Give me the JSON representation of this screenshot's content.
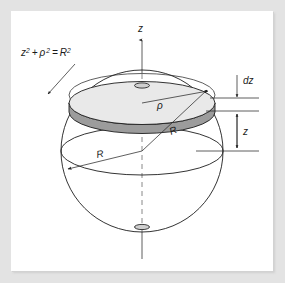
{
  "figure": {
    "background_color": "#e3e3e3",
    "panel_color": "#ffffff",
    "line_color": "#1d1d1d",
    "disk_top_color": "#e9e9e9",
    "disk_side_color": "#9c9c9c",
    "axis_dash_color": "#7c7c7c"
  },
  "labels": {
    "equation": {
      "base1": "z",
      "sup1": "2",
      "operator": "+",
      "base2": "ρ",
      "sup2": "2",
      "equals": "=",
      "base3": "R",
      "sup3": "2",
      "full_text": "z² + ρ² = R²"
    },
    "axis_z": "z",
    "disk_radius_rho": "ρ",
    "sphere_radius_slant": "R",
    "sphere_radius_equator": "R",
    "thickness_dz": "dz",
    "height_z": "z"
  },
  "geometry": {
    "sphere_center": [
      131,
      140
    ],
    "sphere_radius_px": 81,
    "disk_center_y": 92,
    "disk_half_width": 73,
    "disk_thickness_px": 9,
    "equator_y": 140,
    "z_axis_top_y": 26,
    "z_axis_bottom_y": 248
  }
}
